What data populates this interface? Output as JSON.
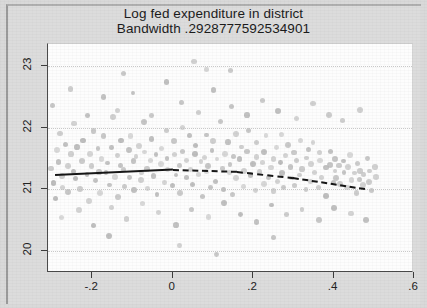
{
  "figure": {
    "title_line1": "Log fed expenditure in district",
    "title_line2": "Bandwidth .2928777592534901"
  },
  "axes": {
    "y_ticks": [
      "20",
      "21",
      "22",
      "23"
    ],
    "x_ticks": [
      "-.2",
      "0",
      ".2",
      ".4",
      ".6"
    ]
  },
  "chart_data": {
    "type": "scatter",
    "title": "Log fed expenditure in district",
    "subtitle": "Bandwidth .2928777592534901",
    "xlabel": "",
    "ylabel": "",
    "xlim": [
      -0.31,
      0.6
    ],
    "ylim": [
      19.65,
      23.35
    ],
    "xticks": [
      -0.2,
      0,
      0.2,
      0.4,
      0.6
    ],
    "yticks": [
      20,
      21,
      22,
      23
    ],
    "xtick_labels": [
      "-.2",
      "0",
      ".2",
      ".4",
      ".6"
    ],
    "ytick_labels": [
      "20",
      "21",
      "22",
      "23"
    ],
    "grid": "horizontal-dotted",
    "legend": "none",
    "cutoff": 0,
    "marker": {
      "color": "#bdbdbd",
      "size_px": 5.4,
      "shape": "circle"
    },
    "series": [
      {
        "name": "binned observations (scatter)",
        "type": "scatter",
        "points": [
          [
            -0.3,
            21.33
          ],
          [
            -0.296,
            21.1
          ],
          [
            -0.292,
            21.62
          ],
          [
            -0.288,
            20.88
          ],
          [
            -0.283,
            21.45
          ],
          [
            -0.279,
            21.92
          ],
          [
            -0.274,
            21.2
          ],
          [
            -0.27,
            21.05
          ],
          [
            -0.266,
            21.72
          ],
          [
            -0.261,
            21.38
          ],
          [
            -0.257,
            20.95
          ],
          [
            -0.252,
            21.55
          ],
          [
            -0.248,
            22.05
          ],
          [
            -0.243,
            21.28
          ],
          [
            -0.239,
            21.15
          ],
          [
            -0.234,
            21.68
          ],
          [
            -0.23,
            21.02
          ],
          [
            -0.225,
            21.48
          ],
          [
            -0.221,
            21.8
          ],
          [
            -0.216,
            21.22
          ],
          [
            -0.212,
            20.8
          ],
          [
            -0.207,
            21.58
          ],
          [
            -0.203,
            21.36
          ],
          [
            -0.198,
            21.95
          ],
          [
            -0.194,
            21.12
          ],
          [
            -0.189,
            21.65
          ],
          [
            -0.185,
            21.3
          ],
          [
            -0.18,
            20.92
          ],
          [
            -0.176,
            21.5
          ],
          [
            -0.171,
            21.85
          ],
          [
            -0.167,
            21.25
          ],
          [
            -0.162,
            21.42
          ],
          [
            -0.158,
            21.08
          ],
          [
            -0.153,
            21.7
          ],
          [
            -0.149,
            22.15
          ],
          [
            -0.144,
            21.18
          ],
          [
            -0.14,
            21.55
          ],
          [
            -0.135,
            20.85
          ],
          [
            -0.131,
            21.4
          ],
          [
            -0.126,
            21.78
          ],
          [
            -0.122,
            21.32
          ],
          [
            -0.117,
            21.02
          ],
          [
            -0.113,
            21.62
          ],
          [
            -0.108,
            21.88
          ],
          [
            -0.104,
            21.2
          ],
          [
            -0.099,
            21.45
          ],
          [
            -0.095,
            20.98
          ],
          [
            -0.09,
            21.52
          ],
          [
            -0.086,
            21.72
          ],
          [
            -0.081,
            21.28
          ],
          [
            -0.077,
            21.15
          ],
          [
            -0.072,
            21.6
          ],
          [
            -0.068,
            22.08
          ],
          [
            -0.063,
            21.35
          ],
          [
            -0.059,
            21.0
          ],
          [
            -0.054,
            21.48
          ],
          [
            -0.05,
            21.82
          ],
          [
            -0.045,
            21.22
          ],
          [
            -0.041,
            21.58
          ],
          [
            -0.036,
            20.9
          ],
          [
            -0.032,
            21.42
          ],
          [
            -0.027,
            21.68
          ],
          [
            -0.023,
            21.12
          ],
          [
            -0.018,
            21.5
          ],
          [
            -0.014,
            21.95
          ],
          [
            -0.009,
            21.3
          ],
          [
            -0.005,
            21.05
          ],
          [
            0.0,
            21.55
          ],
          [
            0.005,
            21.78
          ],
          [
            0.009,
            21.25
          ],
          [
            0.014,
            21.4
          ],
          [
            0.018,
            20.95
          ],
          [
            0.023,
            21.62
          ],
          [
            0.027,
            22.02
          ],
          [
            0.032,
            21.18
          ],
          [
            0.036,
            21.48
          ],
          [
            0.041,
            21.85
          ],
          [
            0.045,
            21.32
          ],
          [
            0.05,
            21.08
          ],
          [
            0.054,
            21.58
          ],
          [
            0.059,
            21.72
          ],
          [
            0.063,
            21.22
          ],
          [
            0.068,
            21.45
          ],
          [
            0.072,
            20.88
          ],
          [
            0.077,
            21.52
          ],
          [
            0.081,
            21.9
          ],
          [
            0.086,
            21.28
          ],
          [
            0.09,
            21.38
          ],
          [
            0.095,
            21.02
          ],
          [
            0.099,
            21.65
          ],
          [
            0.104,
            21.8
          ],
          [
            0.108,
            21.15
          ],
          [
            0.113,
            21.5
          ],
          [
            0.117,
            22.12
          ],
          [
            0.122,
            21.32
          ],
          [
            0.126,
            21.0
          ],
          [
            0.131,
            21.6
          ],
          [
            0.135,
            21.75
          ],
          [
            0.14,
            21.25
          ],
          [
            0.144,
            21.42
          ],
          [
            0.149,
            20.92
          ],
          [
            0.153,
            21.55
          ],
          [
            0.158,
            21.88
          ],
          [
            0.162,
            21.18
          ],
          [
            0.167,
            21.48
          ],
          [
            0.171,
            21.7
          ],
          [
            0.176,
            21.3
          ],
          [
            0.18,
            21.05
          ],
          [
            0.185,
            21.62
          ],
          [
            0.189,
            21.95
          ],
          [
            0.194,
            21.22
          ],
          [
            0.198,
            21.4
          ],
          [
            0.203,
            20.98
          ],
          [
            0.207,
            21.52
          ],
          [
            0.212,
            21.78
          ],
          [
            0.216,
            21.28
          ],
          [
            0.221,
            21.45
          ],
          [
            0.225,
            21.1
          ],
          [
            0.23,
            21.58
          ],
          [
            0.234,
            21.85
          ],
          [
            0.239,
            21.2
          ],
          [
            0.243,
            21.35
          ],
          [
            0.248,
            20.95
          ],
          [
            0.252,
            21.5
          ],
          [
            0.257,
            21.68
          ],
          [
            0.261,
            21.15
          ],
          [
            0.266,
            21.42
          ],
          [
            0.27,
            21.9
          ],
          [
            0.274,
            21.25
          ],
          [
            0.279,
            21.02
          ],
          [
            0.283,
            21.55
          ],
          [
            0.288,
            21.72
          ],
          [
            0.292,
            21.18
          ],
          [
            0.297,
            21.38
          ],
          [
            0.301,
            21.6
          ],
          [
            0.306,
            21.08
          ],
          [
            0.31,
            21.45
          ],
          [
            0.315,
            21.8
          ],
          [
            0.319,
            21.22
          ],
          [
            0.324,
            21.32
          ],
          [
            0.328,
            21.0
          ],
          [
            0.333,
            21.52
          ],
          [
            0.337,
            21.65
          ],
          [
            0.342,
            21.15
          ],
          [
            0.346,
            21.4
          ],
          [
            0.351,
            21.75
          ],
          [
            0.355,
            21.25
          ],
          [
            0.36,
            21.05
          ],
          [
            0.364,
            21.48
          ],
          [
            0.369,
            21.58
          ],
          [
            0.373,
            21.18
          ],
          [
            0.378,
            21.35
          ],
          [
            0.382,
            20.9
          ],
          [
            0.387,
            21.42
          ],
          [
            0.391,
            21.62
          ],
          [
            0.396,
            21.12
          ],
          [
            0.4,
            21.3
          ],
          [
            0.405,
            21.5
          ],
          [
            0.409,
            21.2
          ],
          [
            0.414,
            21.38
          ],
          [
            0.419,
            21.08
          ],
          [
            0.423,
            21.45
          ],
          [
            0.428,
            21.28
          ],
          [
            0.432,
            21.02
          ],
          [
            0.437,
            21.35
          ],
          [
            0.441,
            21.55
          ],
          [
            0.446,
            21.15
          ],
          [
            0.45,
            21.25
          ],
          [
            0.455,
            20.95
          ],
          [
            0.459,
            21.4
          ],
          [
            0.464,
            21.18
          ],
          [
            0.468,
            21.32
          ],
          [
            0.473,
            21.05
          ],
          [
            0.477,
            21.22
          ],
          [
            0.482,
            21.48
          ],
          [
            0.486,
            21.12
          ],
          [
            0.491,
            21.28
          ],
          [
            0.495,
            20.98
          ],
          [
            0.5,
            21.35
          ],
          [
            0.505,
            21.18
          ],
          [
            -0.295,
            22.35
          ],
          [
            -0.255,
            22.6
          ],
          [
            -0.215,
            22.22
          ],
          [
            -0.175,
            22.48
          ],
          [
            -0.135,
            22.3
          ],
          [
            -0.095,
            22.55
          ],
          [
            -0.055,
            22.18
          ],
          [
            -0.015,
            22.72
          ],
          [
            0.025,
            22.4
          ],
          [
            0.065,
            22.25
          ],
          [
            0.105,
            22.62
          ],
          [
            0.145,
            22.35
          ],
          [
            0.185,
            22.2
          ],
          [
            0.225,
            22.45
          ],
          [
            0.265,
            22.28
          ],
          [
            0.305,
            22.15
          ],
          [
            0.345,
            22.38
          ],
          [
            0.385,
            22.22
          ],
          [
            0.425,
            22.1
          ],
          [
            0.465,
            22.3
          ],
          [
            -0.275,
            20.55
          ],
          [
            -0.235,
            20.68
          ],
          [
            -0.195,
            20.42
          ],
          [
            -0.155,
            20.72
          ],
          [
            -0.115,
            20.5
          ],
          [
            -0.075,
            20.78
          ],
          [
            -0.035,
            20.6
          ],
          [
            0.005,
            20.45
          ],
          [
            0.045,
            20.7
          ],
          [
            0.085,
            20.55
          ],
          [
            0.125,
            20.8
          ],
          [
            0.165,
            20.62
          ],
          [
            0.205,
            20.48
          ],
          [
            0.245,
            20.75
          ],
          [
            0.285,
            20.58
          ],
          [
            0.325,
            20.65
          ],
          [
            0.365,
            20.52
          ],
          [
            0.405,
            20.7
          ],
          [
            0.445,
            20.6
          ],
          [
            0.485,
            20.48
          ],
          [
            0.05,
            23.05
          ],
          [
            0.085,
            22.95
          ],
          [
            0.02,
            20.1
          ],
          [
            0.11,
            19.95
          ],
          [
            -0.16,
            20.25
          ],
          [
            0.25,
            20.22
          ],
          [
            0.14,
            22.9
          ],
          [
            -0.12,
            22.85
          ]
        ]
      },
      {
        "name": "local linear fit (left of cutoff, solid)",
        "type": "line",
        "style": "solid",
        "color": "#161616",
        "points": [
          [
            -0.292,
            21.25
          ],
          [
            0.0,
            21.34
          ]
        ]
      },
      {
        "name": "local linear fit (right of cutoff, dashed)",
        "type": "line",
        "style": "dashed",
        "color": "#161616",
        "points": [
          [
            0.0,
            21.33
          ],
          [
            0.16,
            21.3
          ],
          [
            0.3,
            21.2
          ],
          [
            0.48,
            21.02
          ]
        ]
      }
    ]
  }
}
